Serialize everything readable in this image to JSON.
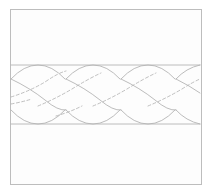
{
  "figure": {
    "alt_text": "A square framed panel containing a horizontal three-strand braid drawn in light grey, with dashed lines marking strand boundaries that pass behind other strands.",
    "background_color": "#ffffff",
    "panel_color": "#fdfdfd"
  },
  "frame": {
    "name": "panel-border",
    "x": 10,
    "y": 9,
    "width": 191,
    "height": 175,
    "stroke_color": "#bdbdbd",
    "stroke_width": 1
  },
  "braid": {
    "name": "three-strand-braid",
    "strand_count": 3,
    "period_px": 55,
    "band_top_y": 65,
    "band_bottom_y": 124,
    "band_center_y": 94,
    "left_x": 11,
    "right_x": 200,
    "solid_stroke_color": "#b4b4b4",
    "dashed_stroke_color": "#b8b8b8",
    "stroke_width": 0.9,
    "dash_pattern": "3 2.4",
    "crossings": [
      {
        "x": 38,
        "y": 65,
        "type": "top-cusp"
      },
      {
        "x": 93,
        "y": 65,
        "type": "top-cusp"
      },
      {
        "x": 148,
        "y": 65,
        "type": "top-cusp"
      },
      {
        "x": 38,
        "y": 124,
        "type": "bottom-cusp"
      },
      {
        "x": 93,
        "y": 124,
        "type": "bottom-cusp"
      },
      {
        "x": 148,
        "y": 124,
        "type": "bottom-cusp"
      }
    ]
  },
  "geometry": {
    "top_edge_segments": [
      "M 11 65 L 200 65",
      "M 11 124 L 200 124"
    ],
    "upper_arcs": [
      "M 11 79 Q 24 65 38 65 Q 52 65 65 79",
      "M 66 79 Q 79 65 93 65 Q 107 65 120 79",
      "M 121 79 Q 134 65 148 65 Q 162 65 175 79",
      "M 176 79 Q 186 68 200 65"
    ],
    "lower_arcs": [
      "M 11 110 Q 24 124 38 124 Q 52 124 65 110",
      "M 66 110 Q 79 124 93 124 Q 107 124 120 110",
      "M 121 110 Q 134 124 148 124 Q 162 124 175 110",
      "M 176 110 Q 186 121 200 124"
    ],
    "diagonal_solid": [
      "M 11 79 Q 30 88 45 100 Q 58 111 66 110",
      "M 66 79 Q 85 88 100 100 Q 113 111 121 110",
      "M 121 79 Q 140 88 155 100 Q 168 111 176 110",
      "M 176 79 Q 190 86 200 93"
    ],
    "diagonal_dashed": [
      "M 11 97 Q 30 91 45 82 Q 58 73 66 71",
      "M 38 106 Q 55 99 72 89 Q 88 79 101 73",
      "M 93 106 Q 110 99 127 89 Q 143 79 156 73",
      "M 148 106 Q 165 99 182 89 Q 193 82 200 79",
      "M 11 104 Q 22 102 32 99",
      "M 56 116 Q 70 112 82 106"
    ]
  },
  "labels": {
    "none_visible": true
  }
}
